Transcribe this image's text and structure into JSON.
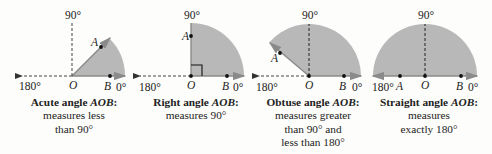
{
  "colors": {
    "wedge_fill": "#b8b8b8",
    "ray": "#8a8a8a",
    "dashed": "#444444",
    "point": "#111111",
    "background": "#fdfdfb"
  },
  "diagrams": [
    {
      "id": "acute",
      "labels": {
        "deg90": "90°",
        "deg180": "180°",
        "deg0": "0°",
        "O": "O",
        "A": "A",
        "B": "B"
      },
      "caption": {
        "title_prefix": "Acute angle ",
        "title_angle": "AOB",
        "title_suffix": ":",
        "lines": [
          "measures less",
          "than 90°"
        ]
      },
      "angle_deg": 45
    },
    {
      "id": "right",
      "labels": {
        "deg90": "90°",
        "deg180": "180°",
        "deg0": "0°",
        "O": "O",
        "A": "A",
        "B": "B"
      },
      "caption": {
        "title_prefix": "Right angle ",
        "title_angle": "AOB",
        "title_suffix": ":",
        "lines": [
          "measures 90°"
        ]
      },
      "angle_deg": 90
    },
    {
      "id": "obtuse",
      "labels": {
        "deg90": "90°",
        "deg180": "180°",
        "deg0": "0°",
        "O": "O",
        "A": "A",
        "B": "B"
      },
      "caption": {
        "title_prefix": "Obtuse angle ",
        "title_angle": "AOB",
        "title_suffix": ":",
        "lines": [
          "measures greater",
          "than 90° and",
          "less than 180°"
        ]
      },
      "angle_deg": 140
    },
    {
      "id": "straight",
      "labels": {
        "deg90": "90°",
        "deg180": "180°",
        "deg0": "0°",
        "O": "O",
        "A": "A",
        "B": "B"
      },
      "caption": {
        "title_prefix": "Straight angle ",
        "title_angle": "AOB",
        "title_suffix": ":",
        "lines": [
          "measures",
          "exactly 180°"
        ]
      },
      "angle_deg": 180
    }
  ]
}
